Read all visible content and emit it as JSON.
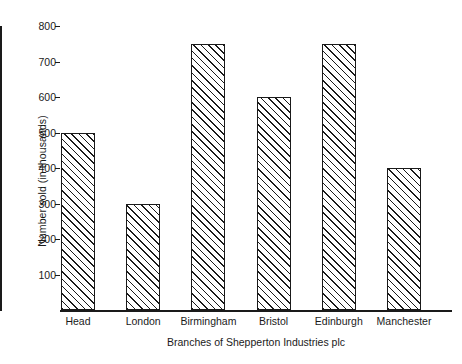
{
  "chart_data": {
    "type": "bar",
    "title": "",
    "categories": [
      "Head",
      "London",
      "Birmingham",
      "Bristol",
      "Edinburgh",
      "Manchester"
    ],
    "values": [
      500,
      300,
      750,
      600,
      750,
      400
    ],
    "xlabel": "Branches of Shepperton Industries plc",
    "ylabel": "Number sold (in thousands)",
    "ylim": [
      0,
      800
    ],
    "ytick_labels": [
      "100",
      "200",
      "300",
      "400",
      "500",
      "600",
      "700",
      "800"
    ],
    "ytick_values": [
      100,
      200,
      300,
      400,
      500,
      600,
      700,
      800
    ],
    "grid": false,
    "legend": false,
    "bar_fill": "hatched-diagonal",
    "bar_color": "#1a1a1a",
    "background": "#ffffff"
  }
}
